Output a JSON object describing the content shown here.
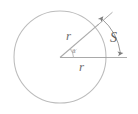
{
  "figure": {
    "type": "geometry-diagram",
    "background_color": "#ffffff",
    "stroke_color": "#b0b0b0",
    "label_color": "#6f6f6f",
    "labels": {
      "radius_diagonal": "r",
      "radius_horizontal": "r",
      "arc_length": "S",
      "angle": "a"
    },
    "geometry": {
      "circle": {
        "cx": 60,
        "cy": 57,
        "r": 46
      },
      "radius_horizontal": {
        "x1": 60,
        "y1": 57.5,
        "x2": 106,
        "y2": 57.5
      },
      "radius_diagonal": {
        "x1": 60,
        "y1": 57.5,
        "x2": 98.5,
        "y2": 24.5
      },
      "angle_marker": {
        "cx": 60,
        "cy": 57.5,
        "r": 13,
        "start_deg": 0,
        "end_deg": 40.6
      },
      "arc_measure": {
        "cx": 60,
        "cy": 57.5,
        "r": 60,
        "start_deg": 40.6,
        "end_deg": 0
      },
      "tick_top": {
        "x1": 98.5,
        "y1": 24.5,
        "x2": 113,
        "y2": 12
      },
      "tick_bottom": {
        "x1": 106,
        "y1": 57.5,
        "x2": 126,
        "y2": 57.5
      }
    }
  }
}
